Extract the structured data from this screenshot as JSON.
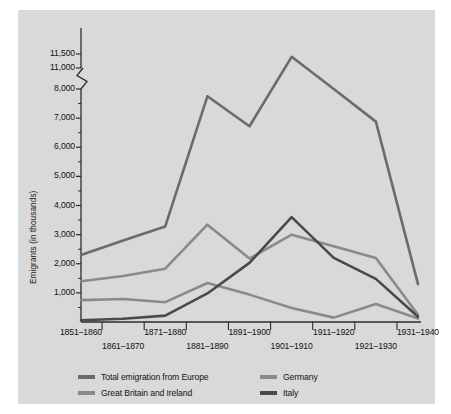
{
  "chart_data": {
    "type": "line",
    "title": "",
    "xlabel": "",
    "ylabel": "Emigrants (in thousands)",
    "categories": [
      "1851–1860",
      "1861–1870",
      "1871–1880",
      "1881–1890",
      "1891–1900",
      "1901–1910",
      "1911–1920",
      "1921–1930",
      "1931–1940"
    ],
    "ytick_labels": [
      "1,000",
      "2,000",
      "3,000",
      "4,000",
      "5,000",
      "6,000",
      "7,000",
      "8,000",
      "11,000",
      "11,500"
    ],
    "ytick_values": [
      1000,
      2000,
      3000,
      4000,
      5000,
      6000,
      7000,
      8000,
      11000,
      11500
    ],
    "ylim": [
      0,
      11500
    ],
    "axis_break": {
      "present": true,
      "below": 8000,
      "above": 11000
    },
    "grid": false,
    "legend_position": "bottom",
    "series": [
      {
        "name": "Total emigration from Europe",
        "color": "#6b6b6b",
        "values": [
          2300,
          2800,
          3280,
          7750,
          6720,
          11400,
          8000,
          6880,
          1300
        ]
      },
      {
        "name": "Great Britain and Ireland",
        "color": "#8a8a8a",
        "values": [
          750,
          790,
          680,
          1340,
          940,
          480,
          150,
          620,
          120
        ]
      },
      {
        "name": "Germany",
        "color": "#8a8a8a",
        "values": [
          1400,
          1580,
          1830,
          3340,
          2180,
          3000,
          2600,
          2200,
          250
        ]
      },
      {
        "name": "Italy",
        "color": "#4a4a4a",
        "values": [
          60,
          110,
          220,
          980,
          2030,
          3600,
          2200,
          1480,
          180
        ]
      }
    ]
  },
  "legend": {
    "items": [
      {
        "label": "Total emigration from Europe",
        "color": "#6b6b6b"
      },
      {
        "label": "Great Britain and Ireland",
        "color": "#8a8a8a"
      },
      {
        "label": "Germany",
        "color": "#8a8a8a"
      },
      {
        "label": "Italy",
        "color": "#4a4a4a"
      }
    ]
  },
  "colors": {
    "panel_background": "#d9d9d9",
    "figure_background": "#ffffff",
    "axis": "#2b2b2b",
    "text": "#111111"
  }
}
